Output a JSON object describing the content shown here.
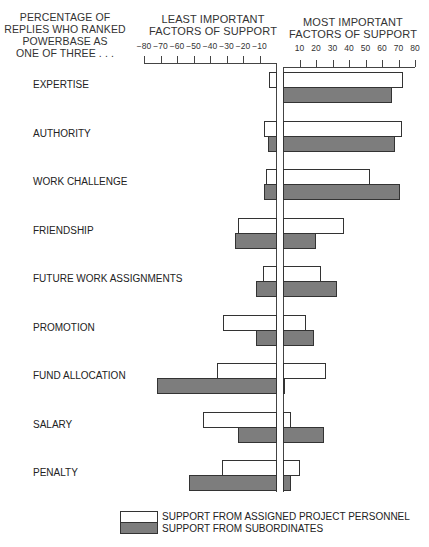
{
  "chart_data": {
    "type": "bar",
    "orientation": "horizontal-diverging",
    "title": "",
    "row_header": "PERCENTAGE OF REPLIES WHO RANKED POWERBASE AS ONE OF THREE . . .",
    "left_axis_title": "LEAST IMPORTANT FACTORS OF SUPPORT",
    "right_axis_title": "MOST IMPORTANT FACTORS OF SUPPORT",
    "left_ticks": [
      "-80",
      "-70",
      "-60",
      "-50",
      "-40",
      "-30",
      "-20",
      "-10"
    ],
    "right_ticks": [
      "10",
      "20",
      "30",
      "40",
      "50",
      "60",
      "70",
      "80"
    ],
    "xlim_left": [
      -80,
      0
    ],
    "xlim_right": [
      0,
      80
    ],
    "categories": [
      "EXPERTISE",
      "AUTHORITY",
      "WORK CHALLENGE",
      "FRIENDSHIP",
      "FUTURE WORK ASSIGNMENTS",
      "PROMOTION",
      "FUND ALLOCATION",
      "SALARY",
      "PENALTY"
    ],
    "series": [
      {
        "name": "SUPPORT FROM ASSIGNED PROJECT PERSONNEL",
        "color": "#ffffff",
        "least_important": [
          -4,
          -7,
          -6,
          -23,
          -8,
          -32,
          -36,
          -44,
          -33
        ],
        "most_important": [
          73,
          72,
          53,
          37,
          23,
          14,
          26,
          5,
          10
        ]
      },
      {
        "name": "SUPPORT FROM SUBORDINATES",
        "color": "#7d7d7d",
        "least_important": [
          0,
          -5,
          -7,
          -25,
          -12,
          -12,
          -72,
          -23,
          -53
        ],
        "most_important": [
          66,
          68,
          71,
          20,
          33,
          19,
          1,
          25,
          5
        ]
      }
    ],
    "legend_position": "bottom-right",
    "grid": false
  },
  "header": {
    "row_header_lines": [
      "PERCENTAGE OF",
      "REPLIES WHO RANKED",
      "POWERBASE AS",
      "ONE OF THREE . . ."
    ],
    "left_title_lines": [
      "LEAST IMPORTANT",
      "FACTORS OF SUPPORT"
    ],
    "right_title_lines": [
      "MOST IMPORTANT",
      "FACTORS OF SUPPORT"
    ]
  },
  "legend": {
    "items": [
      {
        "label": "SUPPORT FROM ASSIGNED PROJECT PERSONNEL",
        "color": "#ffffff"
      },
      {
        "label": "SUPPORT FROM SUBORDINATES",
        "color": "#7d7d7d"
      }
    ]
  }
}
